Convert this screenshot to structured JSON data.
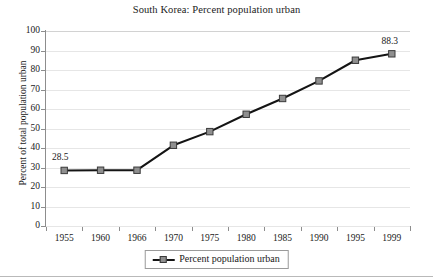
{
  "chart_data": {
    "type": "line",
    "title": "South Korea: Percent population urban",
    "xlabel": "",
    "ylabel": "Percent of total population urban",
    "categories": [
      "1955",
      "1960",
      "1966",
      "1970",
      "1975",
      "1980",
      "1985",
      "1990",
      "1995",
      "1999"
    ],
    "series": [
      {
        "name": "Percent population urban",
        "values": [
          28.5,
          28.6,
          28.6,
          41.4,
          48.4,
          57.3,
          65.4,
          74.4,
          85.0,
          88.3
        ],
        "marker": "square",
        "marker_color": "#8f8f8f",
        "line_color": "#141414"
      }
    ],
    "ylim": [
      0,
      100
    ],
    "yticks": [
      0,
      10,
      20,
      30,
      40,
      50,
      60,
      70,
      80,
      90,
      100
    ],
    "grid": true,
    "grid_axis": "y",
    "legend": {
      "position": "bottom-center",
      "entries": [
        "Percent population urban"
      ]
    },
    "annotations": [
      {
        "text": "28.5",
        "category": "1955",
        "value": 28.5
      },
      {
        "text": "88.3",
        "category": "1999",
        "value": 88.3
      }
    ]
  }
}
